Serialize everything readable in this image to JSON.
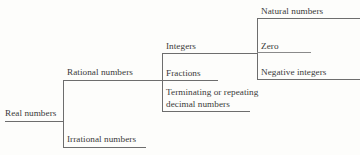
{
  "diagram": {
    "line_color": "#6d6d6d",
    "text_color": "#3a3a3a",
    "background": "#fdfdfb",
    "nodes": {
      "real_numbers": "Real numbers",
      "rational_numbers": "Rational numbers",
      "irrational_numbers": "Irrational numbers",
      "integers": "Integers",
      "fractions": "Fractions",
      "decimals_line1": "Terminating or repeating",
      "decimals_line2": "decimal numbers",
      "natural_numbers": "Natural numbers",
      "zero": "Zero",
      "negative_integers": "Negative integers"
    }
  }
}
